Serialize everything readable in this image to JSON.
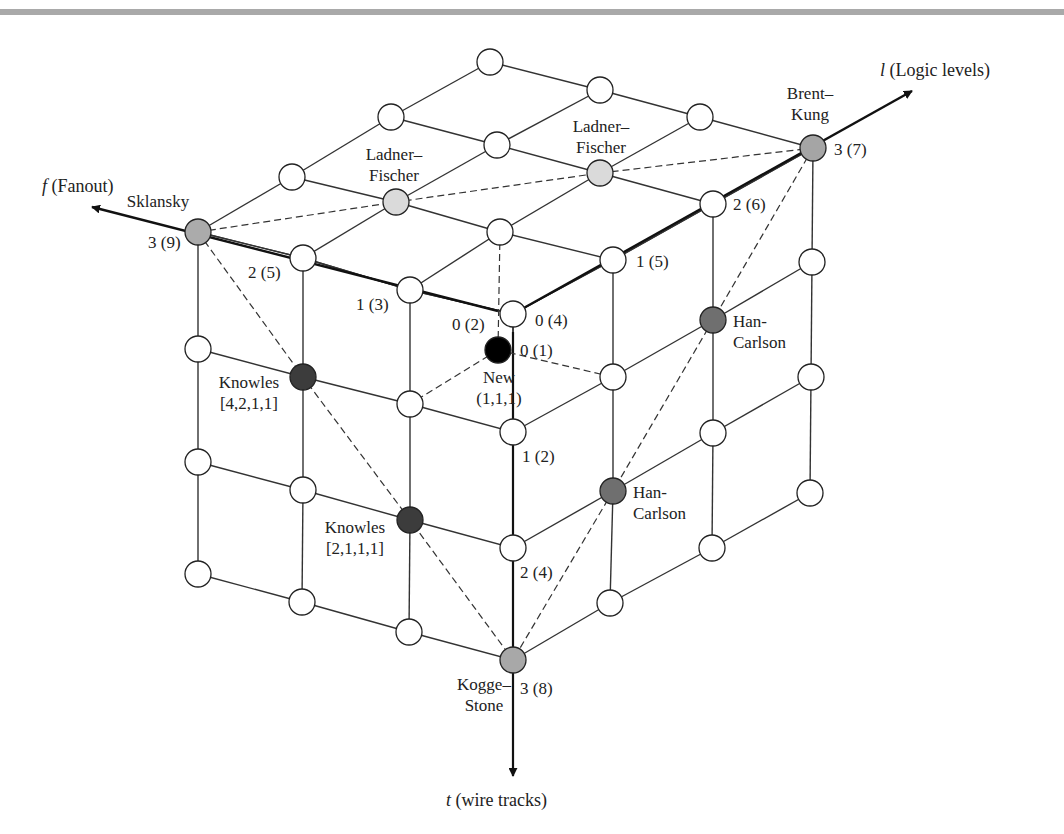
{
  "colors": {
    "line": "#333333",
    "node_empty": "#ffffff",
    "sklansky": "#ababab",
    "ladner_fischer": "#dadada",
    "brent_kung": "#a5a5a5",
    "kogge_stone": "#a8a8a8",
    "knowles": "#3c3c3c",
    "han_carlson": "#6f6f6f",
    "new": "#000000",
    "top_bar": "#a9a9a9"
  },
  "axes": {
    "fanout": {
      "symbol": "f",
      "label": " (Fanout)",
      "from": [
        498,
        311
      ],
      "to": [
        92,
        207
      ],
      "label_pos": [
        42,
        192
      ]
    },
    "logic": {
      "symbol": "l",
      "label": " (Logic levels)",
      "from": [
        513,
        314
      ],
      "to": [
        912,
        91
      ],
      "label_pos": [
        880,
        76
      ]
    },
    "wire": {
      "symbol": "t",
      "label": " (wire tracks)",
      "from": [
        513,
        332
      ],
      "to": [
        513,
        776
      ],
      "label_pos": [
        446,
        806
      ]
    }
  },
  "grid": {
    "origin": [
      513,
      314
    ],
    "front_face": {
      "f0": [
        [
          513,
          314
        ],
        [
          513,
          432
        ],
        [
          513,
          548
        ],
        [
          513,
          660
        ]
      ],
      "f1": [
        [
          410,
          290
        ],
        [
          410,
          404
        ],
        [
          410,
          520
        ],
        [
          409,
          632
        ]
      ],
      "f2": [
        [
          303,
          258
        ],
        [
          303,
          377
        ],
        [
          303,
          490
        ],
        [
          302,
          602
        ]
      ],
      "f3": [
        [
          198,
          232
        ],
        [
          198,
          349
        ],
        [
          198,
          462
        ],
        [
          198,
          574
        ]
      ]
    },
    "right_face": {
      "l0": [
        [
          513,
          314
        ],
        [
          513,
          432
        ],
        [
          513,
          548
        ],
        [
          513,
          660
        ]
      ],
      "l1": [
        [
          613,
          260
        ],
        [
          613,
          377
        ],
        [
          613,
          491
        ],
        [
          610,
          603
        ]
      ],
      "l2": [
        [
          713,
          204
        ],
        [
          713,
          320
        ],
        [
          713,
          433
        ],
        [
          712,
          548
        ]
      ],
      "l3": [
        [
          813,
          148
        ],
        [
          812,
          262
        ],
        [
          811,
          377
        ],
        [
          810,
          493
        ]
      ]
    },
    "top_face": {
      "f0": [
        [
          513,
          314
        ],
        [
          613,
          260
        ],
        [
          713,
          204
        ],
        [
          813,
          148
        ]
      ],
      "f1": [
        [
          410,
          290
        ],
        [
          500,
          232
        ],
        [
          600,
          173
        ],
        [
          700,
          117
        ]
      ],
      "f2": [
        [
          303,
          258
        ],
        [
          396,
          202
        ],
        [
          497,
          145
        ],
        [
          600,
          90
        ]
      ],
      "f3": [
        [
          198,
          232
        ],
        [
          292,
          177
        ],
        [
          391,
          117
        ],
        [
          490,
          62
        ]
      ]
    }
  },
  "special_nodes": [
    {
      "name": "Sklansky",
      "pos": [
        198,
        232
      ],
      "fill": "sklansky",
      "label_lines": [
        "Sklansky"
      ],
      "label_pos": [
        158,
        207
      ],
      "anchor": "middle"
    },
    {
      "name": "Ladner-Fischer (f2,l1)",
      "pos": [
        396,
        202
      ],
      "fill": "ladner_fischer",
      "label_lines": [
        "Ladner–",
        "Fischer"
      ],
      "label_pos": [
        394,
        160
      ],
      "anchor": "middle"
    },
    {
      "name": "Ladner-Fischer (f1,l2)",
      "pos": [
        600,
        173
      ],
      "fill": "ladner_fischer",
      "label_lines": [
        "Ladner–",
        "Fischer"
      ],
      "label_pos": [
        601,
        132
      ],
      "anchor": "middle"
    },
    {
      "name": "Brent-Kung",
      "pos": [
        813,
        148
      ],
      "fill": "brent_kung",
      "label_lines": [
        "Brent–",
        "Kung"
      ],
      "label_pos": [
        810,
        99
      ],
      "anchor": "middle"
    },
    {
      "name": "Knowles [4,2,1,1]",
      "pos": [
        303,
        377
      ],
      "fill": "knowles",
      "label_lines": [
        "Knowles",
        "[4,2,1,1]"
      ],
      "label_pos": [
        249,
        388
      ],
      "anchor": "middle"
    },
    {
      "name": "Knowles [2,1,1,1]",
      "pos": [
        410,
        520
      ],
      "fill": "knowles",
      "label_lines": [
        "Knowles",
        "[2,1,1,1]"
      ],
      "label_pos": [
        355,
        533
      ],
      "anchor": "middle"
    },
    {
      "name": "Han-Carlson (l2,t1)",
      "pos": [
        713,
        320
      ],
      "fill": "han_carlson",
      "label_lines": [
        "Han-",
        "Carlson"
      ],
      "label_pos": [
        733,
        327
      ],
      "anchor": "start"
    },
    {
      "name": "Han-Carlson (l1,t2)",
      "pos": [
        613,
        491
      ],
      "fill": "han_carlson",
      "label_lines": [
        "Han-",
        "Carlson"
      ],
      "label_pos": [
        633,
        498
      ],
      "anchor": "start"
    },
    {
      "name": "Kogge-Stone",
      "pos": [
        513,
        660
      ],
      "fill": "kogge_stone",
      "label_lines": [
        "Kogge–",
        "Stone"
      ],
      "label_pos": [
        484,
        690
      ],
      "anchor": "middle"
    },
    {
      "name": "New",
      "pos": [
        498,
        350
      ],
      "fill": "new",
      "label_lines": [
        "New",
        "(1,1,1)"
      ],
      "label_pos": [
        499,
        383
      ],
      "anchor": "middle"
    }
  ],
  "dashed_lines": [
    [
      [
        198,
        232
      ],
      [
        396,
        202
      ],
      [
        600,
        173
      ],
      [
        813,
        148
      ]
    ],
    [
      [
        198,
        232
      ],
      [
        303,
        377
      ],
      [
        410,
        520
      ],
      [
        513,
        660
      ]
    ],
    [
      [
        813,
        148
      ],
      [
        713,
        320
      ],
      [
        613,
        491
      ],
      [
        513,
        660
      ]
    ],
    [
      [
        500,
        232
      ],
      [
        498,
        350
      ]
    ],
    [
      [
        498,
        350
      ],
      [
        410,
        404
      ]
    ],
    [
      [
        498,
        350
      ],
      [
        613,
        377
      ]
    ]
  ],
  "axis_tick_labels": [
    {
      "text": "3 (9)",
      "pos": [
        148,
        248
      ]
    },
    {
      "text": "2 (5)",
      "pos": [
        248,
        278
      ]
    },
    {
      "text": "1 (3)",
      "pos": [
        356,
        310
      ]
    },
    {
      "text": "0 (2)",
      "pos": [
        452,
        330
      ]
    },
    {
      "text": "0 (4)",
      "pos": [
        535,
        326
      ]
    },
    {
      "text": "0 (1)",
      "pos": [
        520,
        356
      ]
    },
    {
      "text": "1 (5)",
      "pos": [
        636,
        267
      ]
    },
    {
      "text": "2 (6)",
      "pos": [
        733,
        210
      ]
    },
    {
      "text": "3 (7)",
      "pos": [
        834,
        155
      ]
    },
    {
      "text": "1 (2)",
      "pos": [
        522,
        462
      ]
    },
    {
      "text": "2 (4)",
      "pos": [
        520,
        578
      ]
    },
    {
      "text": "3 (8)",
      "pos": [
        520,
        694
      ]
    }
  ]
}
